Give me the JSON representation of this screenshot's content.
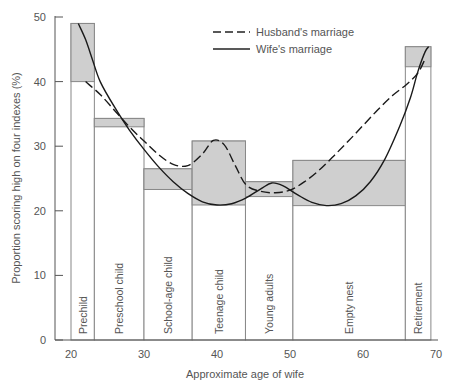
{
  "chart_data": {
    "type": "line",
    "title": "",
    "xlabel": "Approximate age of wife",
    "ylabel": "Proportion scoring high on four indexes (%)",
    "xlim": [
      20,
      70
    ],
    "ylim": [
      0,
      50
    ],
    "x_ticks": [
      20,
      30,
      40,
      50,
      60,
      70
    ],
    "y_ticks": [
      0,
      10,
      20,
      30,
      40,
      50
    ],
    "grid": false,
    "legend_position": "top-center",
    "legend": [
      {
        "name": "Husband's marriage",
        "style": "dashed"
      },
      {
        "name": "Wife's marriage",
        "style": "solid"
      }
    ],
    "stages": [
      {
        "label": "Prechild",
        "age_start": 20,
        "age_end": 23.2,
        "low": 40,
        "high": 49
      },
      {
        "label": "Preschool child",
        "age_start": 23.2,
        "age_end": 30,
        "low": 33,
        "high": 34.3
      },
      {
        "label": "School-age child",
        "age_start": 30,
        "age_end": 36.6,
        "low": 23.3,
        "high": 26.5
      },
      {
        "label": "Teenage child",
        "age_start": 36.6,
        "age_end": 43.9,
        "low": 20.9,
        "high": 30.8
      },
      {
        "label": "Young adults",
        "age_start": 43.9,
        "age_end": 50.4,
        "low": 22.2,
        "high": 24.5
      },
      {
        "label": "Empty nest",
        "age_start": 50.4,
        "age_end": 65.8,
        "low": 20.8,
        "high": 27.8
      },
      {
        "label": "Retirement",
        "age_start": 65.8,
        "age_end": 69.3,
        "low": 42.3,
        "high": 45.4
      }
    ],
    "series": [
      {
        "name": "Husband's marriage",
        "style": "dashed",
        "x": [
          22,
          24,
          26,
          28,
          30,
          32,
          34,
          36,
          38,
          39.5,
          41,
          42.5,
          44,
          46,
          48,
          50,
          52,
          54,
          56,
          58,
          60,
          62,
          64,
          66,
          67.5,
          68.5
        ],
        "y": [
          40,
          38,
          35.5,
          33,
          30.8,
          28.7,
          27.2,
          27,
          28.8,
          30.9,
          30.2,
          27,
          24,
          23,
          22.8,
          23.2,
          24.5,
          26.3,
          28.5,
          30.8,
          33.2,
          35.6,
          37.8,
          39.6,
          41.3,
          43.5
        ]
      },
      {
        "name": "Wife's marriage",
        "style": "solid",
        "x": [
          21,
          22,
          23,
          24,
          26,
          28,
          30,
          32,
          34,
          36,
          38,
          40,
          42,
          44,
          46,
          47.5,
          49,
          51,
          53,
          55,
          57,
          59,
          61,
          63,
          65,
          66.5,
          67.5,
          68.5,
          69
        ],
        "y": [
          49,
          46.5,
          43.2,
          40,
          36,
          32.5,
          29.5,
          26.8,
          24.5,
          22.7,
          21.4,
          20.9,
          21.1,
          22,
          23.4,
          24.3,
          23.9,
          22.5,
          21.3,
          20.8,
          21.1,
          22.3,
          24.5,
          28,
          33,
          37.5,
          41.5,
          44.6,
          45.4
        ]
      }
    ]
  }
}
